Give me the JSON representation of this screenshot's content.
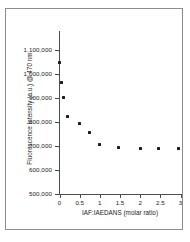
{
  "figure": {
    "has_border": true,
    "background": "#ffffff",
    "marker_color": "#1e1e1e",
    "axis_color": "#4d4d4d"
  },
  "chart_data": {
    "type": "scatter",
    "title": "",
    "xlabel": "IAF:IAEDANS (molar ratio)",
    "ylabel": "Fluorescence Intensity (a.u.) @ 470 nm",
    "xlim": [
      0,
      3
    ],
    "ylim": [
      500000,
      1100000
    ],
    "grid": false,
    "legend": null,
    "xticks": [
      0,
      0.5,
      1,
      1.5,
      2,
      2.5,
      3
    ],
    "xtick_labels": [
      "0",
      "0.5",
      "1",
      "1.5",
      "2",
      "2.5",
      "3"
    ],
    "yticks": [
      500000,
      600000,
      700000,
      800000,
      900000,
      1000000,
      1100000
    ],
    "ytick_labels": [
      "500,000",
      "600,000",
      "700,000",
      "800,000",
      "900,000",
      "1,000,000",
      "1,100,000"
    ],
    "series": [
      {
        "name": "Fluorescence Intensity @ 470 nm",
        "x": [
          0.0,
          0.05,
          0.1,
          0.2,
          0.5,
          0.75,
          1.0,
          1.45,
          2.0,
          2.45,
          2.95
        ],
        "y": [
          1050000,
          965000,
          903000,
          825000,
          792000,
          755000,
          705000,
          692000,
          690000,
          690000,
          688000
        ]
      }
    ]
  }
}
